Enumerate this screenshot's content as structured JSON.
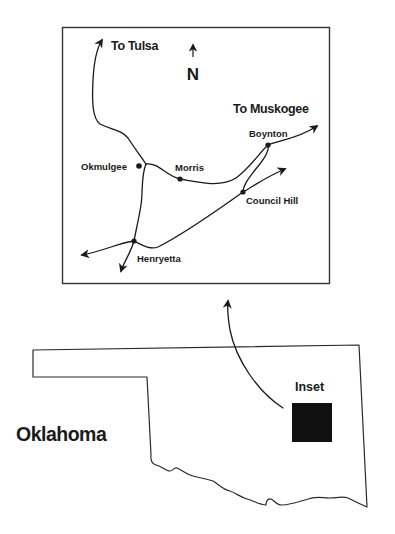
{
  "inset_map": {
    "north_label": "N",
    "destinations": {
      "tulsa": "To Tulsa",
      "muskogee": "To Muskogee"
    },
    "towns": [
      {
        "name": "Okmulgee",
        "x": 139,
        "y": 166
      },
      {
        "name": "Morris",
        "x": 180,
        "y": 179
      },
      {
        "name": "Boynton",
        "x": 268,
        "y": 145
      },
      {
        "name": "Council Hill",
        "x": 243,
        "y": 192
      },
      {
        "name": "Henryetta",
        "x": 134,
        "y": 241
      }
    ]
  },
  "state_map": {
    "state_label": "Oklahoma",
    "inset_label": "Inset"
  },
  "colors": {
    "ink": "#1a1a1a",
    "inset_fill": "#111111",
    "background": "#ffffff"
  }
}
